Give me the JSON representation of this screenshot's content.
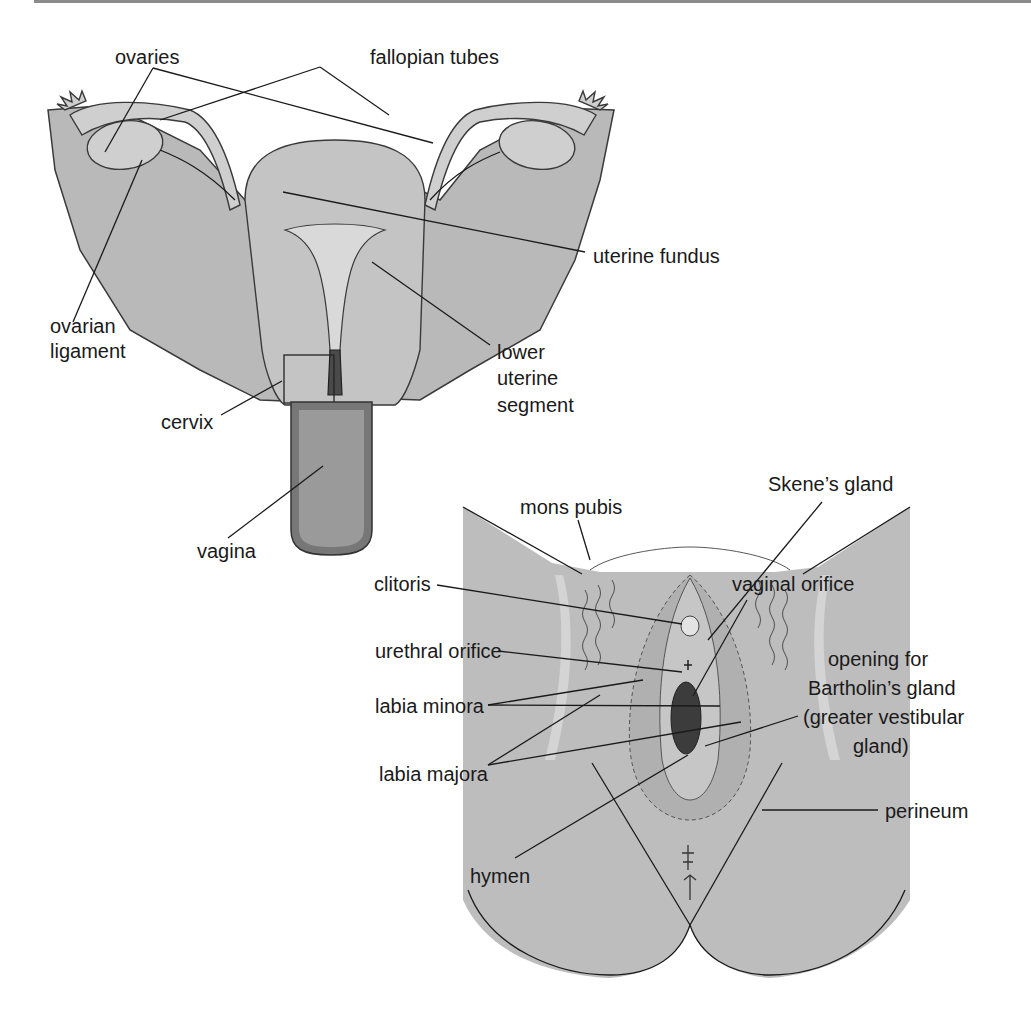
{
  "figure": {
    "top_rule_color": "#8a8a8a",
    "panels": [
      {
        "name": "internal-reproductive-organs",
        "labels": [
          {
            "id": "ovaries",
            "text": "ovaries",
            "x": 115,
            "y": 46
          },
          {
            "id": "fallopian-tubes",
            "text": "fallopian tubes",
            "x": 370,
            "y": 46
          },
          {
            "id": "uterine-fundus",
            "text": "uterine fundus",
            "x": 593,
            "y": 245
          },
          {
            "id": "ovarian-ligament-1",
            "text": "ovarian",
            "x": 50,
            "y": 315
          },
          {
            "id": "ovarian-ligament-2",
            "text": "ligament",
            "x": 50,
            "y": 340
          },
          {
            "id": "lower-uterine-1",
            "text": "lower",
            "x": 497,
            "y": 341
          },
          {
            "id": "lower-uterine-2",
            "text": "uterine",
            "x": 497,
            "y": 367
          },
          {
            "id": "lower-uterine-3",
            "text": "segment",
            "x": 497,
            "y": 394
          },
          {
            "id": "cervix",
            "text": "cervix",
            "x": 161,
            "y": 411
          },
          {
            "id": "vagina",
            "text": "vagina",
            "x": 197,
            "y": 540
          }
        ]
      },
      {
        "name": "external-genitalia",
        "labels": [
          {
            "id": "mons-pubis",
            "text": "mons pubis",
            "x": 520,
            "y": 496
          },
          {
            "id": "skenes-gland",
            "text": "Skene’s gland",
            "x": 768,
            "y": 473
          },
          {
            "id": "clitoris",
            "text": "clitoris",
            "x": 374,
            "y": 573
          },
          {
            "id": "vaginal-orifice",
            "text": "vaginal orifice",
            "x": 732,
            "y": 573
          },
          {
            "id": "urethral-orifice",
            "text": "urethral orifice",
            "x": 375,
            "y": 640
          },
          {
            "id": "bartholin-1",
            "text": "opening for",
            "x": 828,
            "y": 648
          },
          {
            "id": "bartholin-2",
            "text": "Bartholin’s gland",
            "x": 808,
            "y": 677
          },
          {
            "id": "bartholin-3",
            "text": "(greater vestibular",
            "x": 803,
            "y": 706
          },
          {
            "id": "bartholin-4",
            "text": "gland)",
            "x": 853,
            "y": 735
          },
          {
            "id": "labia-minora",
            "text": "labia minora",
            "x": 375,
            "y": 695
          },
          {
            "id": "labia-majora",
            "text": "labia majora",
            "x": 379,
            "y": 763
          },
          {
            "id": "perineum",
            "text": "perineum",
            "x": 885,
            "y": 800
          },
          {
            "id": "hymen",
            "text": "hymen",
            "x": 470,
            "y": 865
          }
        ]
      }
    ]
  }
}
